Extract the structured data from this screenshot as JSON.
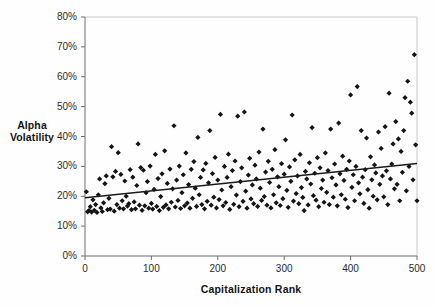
{
  "chart_data": {
    "type": "scatter",
    "title": "",
    "xlabel": "Capitalization Rank",
    "ylabel": "Alpha Volatility",
    "ylabel_lines": [
      "Alpha",
      "Volatility"
    ],
    "xlim": [
      0,
      500
    ],
    "ylim": [
      0,
      0.8
    ],
    "grid": false,
    "legend": null,
    "legend_position": "none",
    "x_ticks": [
      0,
      100,
      200,
      300,
      400,
      500
    ],
    "x_tick_labels": [
      "0",
      "100",
      "200",
      "300",
      "400",
      "500"
    ],
    "y_ticks": [
      0,
      0.1,
      0.2,
      0.3,
      0.4,
      0.5,
      0.6,
      0.7,
      0.8
    ],
    "y_tick_labels": [
      "0%",
      "10%",
      "20%",
      "30%",
      "40%",
      "50%",
      "60%",
      "70%",
      "80%"
    ],
    "marker": "diamond",
    "marker_color": "#141414",
    "marker_size": 2.6,
    "trendline": {
      "type": "linear",
      "label": "",
      "color": "#1b1b1b",
      "x_start": 0,
      "y_start": 0.195,
      "x_end": 500,
      "y_end": 0.31,
      "slope_per_rank": 0.00023,
      "intercept": 0.195
    },
    "series": [
      {
        "name": "Alpha Volatility",
        "points": [
          [
            2,
            0.215
          ],
          [
            4,
            0.148
          ],
          [
            6,
            0.152
          ],
          [
            8,
            0.165
          ],
          [
            10,
            0.147
          ],
          [
            12,
            0.188
          ],
          [
            14,
            0.153
          ],
          [
            16,
            0.172
          ],
          [
            18,
            0.146
          ],
          [
            20,
            0.205
          ],
          [
            22,
            0.258
          ],
          [
            24,
            0.161
          ],
          [
            26,
            0.149
          ],
          [
            28,
            0.178
          ],
          [
            30,
            0.242
          ],
          [
            32,
            0.268
          ],
          [
            34,
            0.155
          ],
          [
            36,
            0.193
          ],
          [
            38,
            0.157
          ],
          [
            40,
            0.366
          ],
          [
            42,
            0.265
          ],
          [
            44,
            0.15
          ],
          [
            46,
            0.283
          ],
          [
            48,
            0.172
          ],
          [
            50,
            0.346
          ],
          [
            52,
            0.16
          ],
          [
            54,
            0.273
          ],
          [
            56,
            0.185
          ],
          [
            58,
            0.158
          ],
          [
            60,
            0.251
          ],
          [
            62,
            0.2
          ],
          [
            64,
            0.167
          ],
          [
            66,
            0.175
          ],
          [
            68,
            0.289
          ],
          [
            70,
            0.155
          ],
          [
            72,
            0.264
          ],
          [
            74,
            0.181
          ],
          [
            76,
            0.158
          ],
          [
            78,
            0.236
          ],
          [
            80,
            0.375
          ],
          [
            82,
            0.17
          ],
          [
            84,
            0.296
          ],
          [
            86,
            0.153
          ],
          [
            88,
            0.287
          ],
          [
            90,
            0.168
          ],
          [
            92,
            0.212
          ],
          [
            94,
            0.249
          ],
          [
            96,
            0.16
          ],
          [
            98,
            0.301
          ],
          [
            100,
            0.176
          ],
          [
            102,
            0.157
          ],
          [
            104,
            0.223
          ],
          [
            106,
            0.34
          ],
          [
            108,
            0.166
          ],
          [
            110,
            0.259
          ],
          [
            112,
            0.152
          ],
          [
            114,
            0.199
          ],
          [
            116,
            0.275
          ],
          [
            118,
            0.163
          ],
          [
            120,
            0.352
          ],
          [
            122,
            0.171
          ],
          [
            124,
            0.243
          ],
          [
            126,
            0.158
          ],
          [
            128,
            0.291
          ],
          [
            130,
            0.18
          ],
          [
            132,
            0.225
          ],
          [
            134,
            0.436
          ],
          [
            136,
            0.164
          ],
          [
            138,
            0.254
          ],
          [
            140,
            0.186
          ],
          [
            142,
            0.301
          ],
          [
            144,
            0.159
          ],
          [
            146,
            0.212
          ],
          [
            148,
            0.272
          ],
          [
            150,
            0.168
          ],
          [
            152,
            0.345
          ],
          [
            154,
            0.177
          ],
          [
            156,
            0.239
          ],
          [
            158,
            0.16
          ],
          [
            160,
            0.29
          ],
          [
            162,
            0.193
          ],
          [
            164,
            0.316
          ],
          [
            166,
            0.227
          ],
          [
            168,
            0.166
          ],
          [
            170,
            0.397
          ],
          [
            172,
            0.205
          ],
          [
            174,
            0.263
          ],
          [
            176,
            0.172
          ],
          [
            178,
            0.288
          ],
          [
            180,
            0.158
          ],
          [
            182,
            0.31
          ],
          [
            184,
            0.183
          ],
          [
            186,
            0.245
          ],
          [
            188,
            0.42
          ],
          [
            190,
            0.17
          ],
          [
            192,
            0.276
          ],
          [
            194,
            0.197
          ],
          [
            196,
            0.33
          ],
          [
            198,
            0.161
          ],
          [
            200,
            0.254
          ],
          [
            202,
            0.189
          ],
          [
            204,
            0.474
          ],
          [
            206,
            0.221
          ],
          [
            208,
            0.168
          ],
          [
            210,
            0.3
          ],
          [
            212,
            0.179
          ],
          [
            214,
            0.263
          ],
          [
            216,
            0.341
          ],
          [
            218,
            0.156
          ],
          [
            220,
            0.232
          ],
          [
            222,
            0.286
          ],
          [
            224,
            0.173
          ],
          [
            226,
            0.318
          ],
          [
            228,
            0.204
          ],
          [
            230,
            0.468
          ],
          [
            232,
            0.165
          ],
          [
            234,
            0.249
          ],
          [
            236,
            0.295
          ],
          [
            238,
            0.183
          ],
          [
            240,
            0.482
          ],
          [
            242,
            0.217
          ],
          [
            244,
            0.16
          ],
          [
            246,
            0.271
          ],
          [
            248,
            0.327
          ],
          [
            250,
            0.191
          ],
          [
            252,
            0.238
          ],
          [
            254,
            0.175
          ],
          [
            256,
            0.304
          ],
          [
            258,
            0.258
          ],
          [
            260,
            0.166
          ],
          [
            262,
            0.348
          ],
          [
            264,
            0.227
          ],
          [
            266,
            0.186
          ],
          [
            268,
            0.425
          ],
          [
            270,
            0.199
          ],
          [
            272,
            0.281
          ],
          [
            274,
            0.17
          ],
          [
            276,
            0.317
          ],
          [
            278,
            0.246
          ],
          [
            280,
            0.161
          ],
          [
            282,
            0.29
          ],
          [
            284,
            0.205
          ],
          [
            286,
            0.356
          ],
          [
            288,
            0.178
          ],
          [
            290,
            0.265
          ],
          [
            292,
            0.232
          ],
          [
            294,
            0.169
          ],
          [
            296,
            0.309
          ],
          [
            298,
            0.192
          ],
          [
            300,
            0.274
          ],
          [
            302,
            0.389
          ],
          [
            304,
            0.22
          ],
          [
            306,
            0.163
          ],
          [
            308,
            0.298
          ],
          [
            310,
            0.25
          ],
          [
            312,
            0.472
          ],
          [
            314,
            0.184
          ],
          [
            316,
            0.322
          ],
          [
            318,
            0.209
          ],
          [
            320,
            0.268
          ],
          [
            322,
            0.175
          ],
          [
            324,
            0.34
          ],
          [
            326,
            0.229
          ],
          [
            328,
            0.196
          ],
          [
            330,
            0.152
          ],
          [
            332,
            0.283
          ],
          [
            334,
            0.258
          ],
          [
            336,
            0.171
          ],
          [
            338,
            0.312
          ],
          [
            340,
            0.241
          ],
          [
            342,
            0.43
          ],
          [
            344,
            0.202
          ],
          [
            346,
            0.277
          ],
          [
            348,
            0.187
          ],
          [
            350,
            0.329
          ],
          [
            352,
            0.165
          ],
          [
            354,
            0.295
          ],
          [
            356,
            0.226
          ],
          [
            358,
            0.254
          ],
          [
            360,
            0.18
          ],
          [
            362,
            0.345
          ],
          [
            364,
            0.213
          ],
          [
            366,
            0.286
          ],
          [
            368,
            0.172
          ],
          [
            370,
            0.425
          ],
          [
            372,
            0.262
          ],
          [
            374,
            0.197
          ],
          [
            376,
            0.308
          ],
          [
            378,
            0.238
          ],
          [
            380,
            0.168
          ],
          [
            382,
            0.445
          ],
          [
            384,
            0.275
          ],
          [
            386,
            0.205
          ],
          [
            388,
            0.334
          ],
          [
            390,
            0.253
          ],
          [
            392,
            0.19
          ],
          [
            394,
            0.29
          ],
          [
            396,
            0.162
          ],
          [
            398,
            0.318
          ],
          [
            400,
            0.539
          ],
          [
            402,
            0.23
          ],
          [
            404,
            0.272
          ],
          [
            406,
            0.185
          ],
          [
            408,
            0.3
          ],
          [
            410,
            0.567
          ],
          [
            412,
            0.245
          ],
          [
            414,
            0.208
          ],
          [
            416,
            0.42
          ],
          [
            418,
            0.264
          ],
          [
            420,
            0.176
          ],
          [
            422,
            0.289
          ],
          [
            424,
            0.395
          ],
          [
            426,
            0.222
          ],
          [
            428,
            0.16
          ],
          [
            430,
            0.332
          ],
          [
            432,
            0.255
          ],
          [
            434,
            0.2
          ],
          [
            436,
            0.305
          ],
          [
            438,
            0.278
          ],
          [
            440,
            0.188
          ],
          [
            442,
            0.415
          ],
          [
            444,
            0.24
          ],
          [
            446,
            0.36
          ],
          [
            448,
            0.268
          ],
          [
            450,
            0.198
          ],
          [
            452,
            0.433
          ],
          [
            454,
            0.285
          ],
          [
            456,
            0.172
          ],
          [
            458,
            0.545
          ],
          [
            460,
            0.258
          ],
          [
            462,
            0.308
          ],
          [
            464,
            0.375
          ],
          [
            466,
            0.225
          ],
          [
            468,
            0.45
          ],
          [
            470,
            0.24
          ],
          [
            472,
            0.392
          ],
          [
            474,
            0.185
          ],
          [
            476,
            0.35
          ],
          [
            478,
            0.28
          ],
          [
            480,
            0.42
          ],
          [
            482,
            0.53
          ],
          [
            484,
            0.218
          ],
          [
            486,
            0.585
          ],
          [
            488,
            0.3
          ],
          [
            490,
            0.515
          ],
          [
            492,
            0.478
          ],
          [
            494,
            0.255
          ],
          [
            496,
            0.674
          ],
          [
            498,
            0.372
          ],
          [
            500,
            0.185
          ]
        ]
      }
    ]
  },
  "axes": {
    "y_title_line1": "Alpha",
    "y_title_line2": "Volatility",
    "x_title": "Capitalization Rank"
  }
}
